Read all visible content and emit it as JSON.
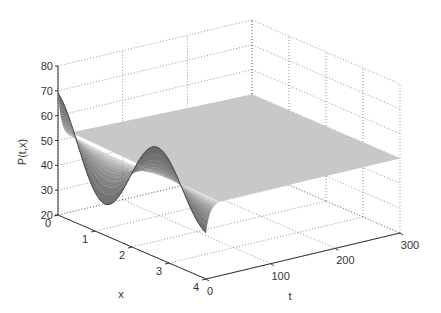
{
  "chart_data": {
    "type": "surface3d",
    "title": "",
    "xlabel": "x",
    "ylabel": "t",
    "zlabel": "P(t,x)",
    "x_range": [
      0,
      4
    ],
    "t_range": [
      0,
      300
    ],
    "z_range": [
      20,
      80
    ],
    "x_ticks": [
      "0",
      "1",
      "2",
      "3",
      "4"
    ],
    "t_ticks": [
      "0",
      "100",
      "200",
      "300"
    ],
    "z_ticks": [
      "20",
      "30",
      "40",
      "50",
      "60",
      "70",
      "80"
    ],
    "grid": true,
    "colormap": "gray",
    "steady_state_value": 50,
    "initial_peak_max": 70,
    "initial_trough_min": 25
  },
  "labels": {
    "x": "x",
    "t": "t",
    "z": "P(t,x)"
  }
}
